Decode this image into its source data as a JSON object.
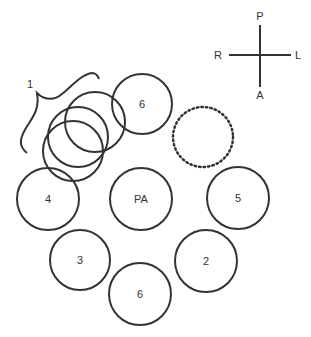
{
  "diagram": {
    "orientation": {
      "top": "P",
      "left": "R",
      "right": "L",
      "bottom": "A"
    },
    "cluster_label": "1",
    "circles": [
      {
        "id": "top6",
        "label": "6"
      },
      {
        "id": "left4",
        "label": "4"
      },
      {
        "id": "center",
        "label": "PA"
      },
      {
        "id": "right5",
        "label": "5"
      },
      {
        "id": "left3",
        "label": "3"
      },
      {
        "id": "right2",
        "label": "2"
      },
      {
        "id": "bottom6",
        "label": "6"
      }
    ],
    "colors": {
      "stroke": "#333333",
      "background": "#ffffff"
    }
  }
}
